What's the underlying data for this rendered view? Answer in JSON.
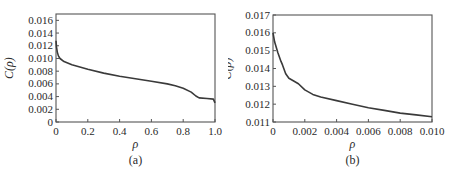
{
  "chart_data": [
    {
      "type": "line",
      "panel_label": "(a)",
      "title": "",
      "xlabel": "ρ",
      "ylabel": "C(ρ)",
      "xlim": [
        0,
        1.0
      ],
      "ylim": [
        0,
        0.017
      ],
      "grid": false,
      "legend": null,
      "x_ticks": [
        "0",
        "0.2",
        "0.4",
        "0.6",
        "0.8",
        "1.0"
      ],
      "x_tick_values": [
        0,
        0.2,
        0.4,
        0.6,
        0.8,
        1.0
      ],
      "y_ticks": [
        "0",
        "0.002",
        "0.004",
        "0.006",
        "0.008",
        "0.010",
        "0.012",
        "0.014",
        "0.016"
      ],
      "y_tick_values": [
        0,
        0.002,
        0.004,
        0.006,
        0.008,
        0.01,
        0.012,
        0.014,
        0.016
      ],
      "series": [
        {
          "name": "C(ρ)",
          "x": [
            0,
            0.003,
            0.008,
            0.015,
            0.025,
            0.05,
            0.1,
            0.2,
            0.3,
            0.4,
            0.5,
            0.6,
            0.7,
            0.75,
            0.8,
            0.85,
            0.88,
            0.9,
            0.95,
            0.99,
            1.0
          ],
          "y": [
            0.0128,
            0.0118,
            0.011,
            0.0104,
            0.01,
            0.0095,
            0.009,
            0.0083,
            0.0077,
            0.0072,
            0.0068,
            0.0064,
            0.006,
            0.0057,
            0.0053,
            0.0047,
            0.0041,
            0.0038,
            0.0037,
            0.0036,
            0.003
          ]
        }
      ]
    },
    {
      "type": "line",
      "panel_label": "(b)",
      "title": "",
      "xlabel": "ρ",
      "ylabel": "C(ρ)",
      "xlim": [
        0,
        0.01
      ],
      "ylim": [
        0.011,
        0.017
      ],
      "grid": false,
      "legend": null,
      "x_ticks": [
        "0",
        "0.002",
        "0.004",
        "0.006",
        "0.008",
        "0.010"
      ],
      "x_tick_values": [
        0,
        0.002,
        0.004,
        0.006,
        0.008,
        0.01
      ],
      "y_ticks": [
        "0.011",
        "0.012",
        "0.013",
        "0.014",
        "0.015",
        "0.016",
        "0.017"
      ],
      "y_tick_values": [
        0.011,
        0.012,
        0.013,
        0.014,
        0.015,
        0.016,
        0.017
      ],
      "series": [
        {
          "name": "C(ρ)",
          "x": [
            0,
            0.0001,
            0.0003,
            0.0005,
            0.0006,
            0.0008,
            0.001,
            0.0013,
            0.0016,
            0.002,
            0.0025,
            0.003,
            0.004,
            0.005,
            0.006,
            0.007,
            0.008,
            0.009,
            0.01
          ],
          "y": [
            0.016,
            0.0155,
            0.0149,
            0.0144,
            0.0142,
            0.0137,
            0.01345,
            0.0133,
            0.01315,
            0.0128,
            0.01255,
            0.0124,
            0.0122,
            0.012,
            0.0118,
            0.01165,
            0.0115,
            0.0114,
            0.0113
          ]
        }
      ]
    }
  ]
}
